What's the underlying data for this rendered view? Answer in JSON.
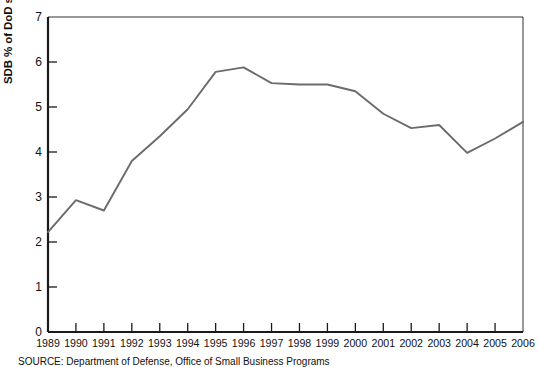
{
  "figure": {
    "source_note": "SOURCE: Department of Defense, Office of Small Business Programs"
  },
  "chart_data": {
    "type": "line",
    "title": "",
    "xlabel": "",
    "ylabel": "SDB % of DoD subcontract dollars",
    "categories": [
      "1989",
      "1990",
      "1991",
      "1992",
      "1993",
      "1994",
      "1995",
      "1996",
      "1997",
      "1998",
      "1999",
      "2000",
      "2001",
      "2002",
      "2003",
      "2004",
      "2005",
      "2006"
    ],
    "values": [
      2.22,
      2.93,
      2.7,
      3.8,
      4.35,
      4.95,
      5.78,
      5.88,
      5.53,
      5.5,
      5.5,
      5.35,
      4.85,
      4.53,
      4.6,
      3.98,
      4.3,
      4.67
    ],
    "ylim": [
      0,
      7
    ],
    "yticks": [
      0,
      1,
      2,
      3,
      4,
      5,
      6,
      7
    ],
    "ytick_labels": [
      "0",
      "1",
      "2",
      "3",
      "4",
      "5",
      "6",
      "7"
    ],
    "grid": false,
    "legend": "none",
    "line_color": "#6b6b6b",
    "axis_color": "#1a1a1a"
  }
}
